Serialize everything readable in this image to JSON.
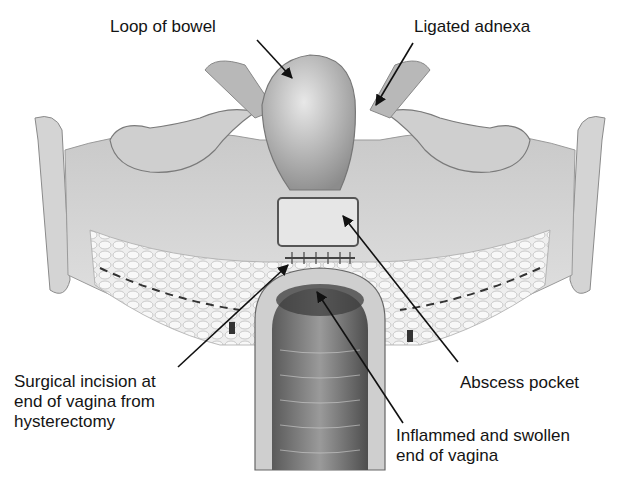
{
  "figure": {
    "labels": {
      "loop_of_bowel": "Loop of bowel",
      "ligated_adnexa": "Ligated adnexa",
      "surgical_incision": [
        "Surgical incision at",
        "end of vagina from",
        "hysterectomy"
      ],
      "abscess_pocket": "Abscess pocket",
      "inflamed_end": [
        "Inflammed and swollen",
        "end of vagina"
      ]
    },
    "colors": {
      "background": "#ffffff",
      "text": "#141414",
      "tissue_light": "#d9d9d9",
      "tissue_mid": "#a8a8a8",
      "tissue_dark": "#4a4a4a"
    }
  }
}
